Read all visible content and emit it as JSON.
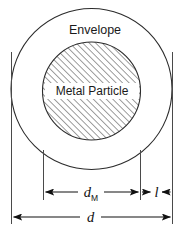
{
  "figure": {
    "labels": {
      "envelope": "Envelope",
      "metal_particle": "Metal Particle"
    },
    "dimensions": [
      {
        "id": "particle-diameter",
        "symbol": "d",
        "subscript": "M",
        "meaning": "metal particle diameter",
        "arrow_style": "double-headed-outward",
        "extension_left_x": 43,
        "extension_right_x": 140,
        "line_y": 192
      },
      {
        "id": "envelope-thickness",
        "symbol": "l",
        "subscript": "",
        "meaning": "envelope layer thickness",
        "arrow_style": "double-headed-inward",
        "extension_left_x": 140,
        "extension_right_x": 172,
        "line_y": 192
      },
      {
        "id": "overall-diameter",
        "symbol": "d",
        "subscript": "",
        "meaning": "overall envelope diameter",
        "arrow_style": "double-headed-outward",
        "extension_left_x": 11,
        "extension_right_x": 172,
        "line_y": 217
      }
    ],
    "shapes": {
      "envelope_circle": {
        "name": "envelope-circle",
        "cx": 91.5,
        "cy": 89,
        "r": 80.5,
        "fill": "#ffffff",
        "stroke": "#2b2b2b"
      },
      "particle_circle": {
        "name": "metal-particle-circle",
        "cx": 91.5,
        "cy": 91,
        "r": 49,
        "fill": "hatched",
        "hatch_angle_deg": 45,
        "hatch_spacing_px": 3.2,
        "stroke": "#2b2b2b"
      }
    },
    "colors": {
      "stroke": "#2b2b2b",
      "dimension_line": "#111111",
      "text": "#1a1a1a",
      "background": "#ffffff",
      "hatch": "#3a3a3a"
    }
  }
}
